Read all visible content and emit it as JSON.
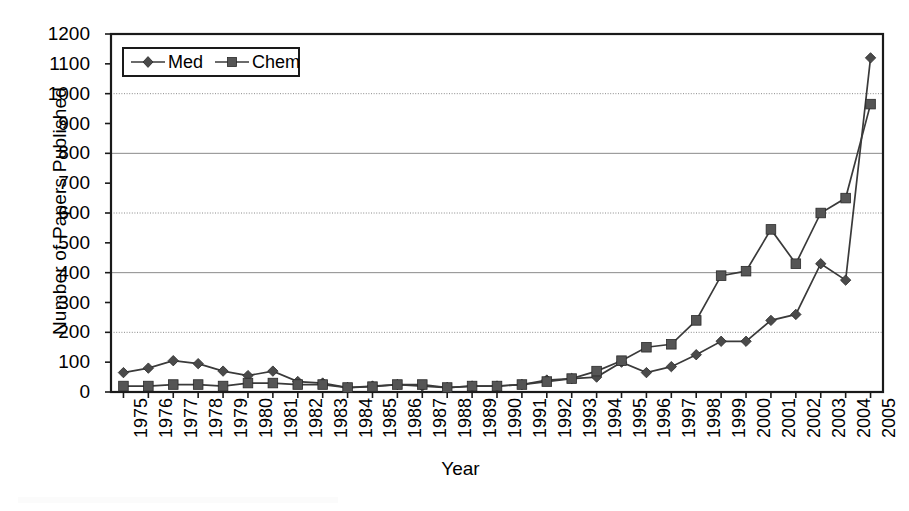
{
  "chart_data": {
    "type": "line",
    "title": "",
    "xlabel": "Year",
    "ylabel": "Number of Papers Published",
    "ylim": [
      0,
      1200
    ],
    "ytick_step": 100,
    "grid": true,
    "grid_axis": "y",
    "legend_position": "top-left-inside",
    "categories": [
      "1975",
      "1976",
      "1977",
      "1978",
      "1979",
      "1980",
      "1981",
      "1982",
      "1983",
      "1984",
      "1985",
      "1986",
      "1987",
      "1988",
      "1989",
      "1990",
      "1991",
      "1992",
      "1993",
      "1994",
      "1995",
      "1996",
      "1997",
      "1998",
      "1999",
      "2000",
      "2001",
      "2002",
      "2003",
      "2004",
      "2005"
    ],
    "ytick_labels": [
      "0",
      "100",
      "200",
      "300",
      "400",
      "500",
      "600",
      "700",
      "800",
      "900",
      "1000",
      "1100",
      "1200"
    ],
    "series": [
      {
        "name": "Med",
        "marker": "diamond",
        "color": "#4a4a4a",
        "values": [
          65,
          80,
          105,
          95,
          70,
          55,
          70,
          35,
          30,
          15,
          20,
          25,
          20,
          15,
          20,
          20,
          25,
          40,
          45,
          50,
          100,
          65,
          85,
          125,
          170,
          170,
          240,
          260,
          430,
          375,
          1120
        ]
      },
      {
        "name": "Chem",
        "marker": "square",
        "color": "#555555",
        "values": [
          20,
          20,
          25,
          25,
          20,
          30,
          30,
          25,
          25,
          15,
          18,
          25,
          25,
          15,
          20,
          20,
          25,
          35,
          45,
          70,
          105,
          150,
          160,
          240,
          390,
          405,
          545,
          430,
          600,
          650,
          965
        ]
      }
    ]
  },
  "axes": {
    "x_title": "Year",
    "y_title": "Number of Papers Published"
  },
  "legend": {
    "items": [
      {
        "label": "Med",
        "marker": "diamond"
      },
      {
        "label": "Chem",
        "marker": "square"
      }
    ]
  }
}
